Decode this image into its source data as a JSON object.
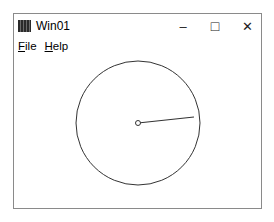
{
  "window": {
    "title": "Win01",
    "app_icon": "app-icon",
    "controls": {
      "minimize": "–",
      "maximize": "□",
      "close": "✕"
    }
  },
  "menubar": {
    "items": [
      {
        "label_first": "F",
        "label_rest": "ile"
      },
      {
        "label_first": "H",
        "label_rest": "elp"
      }
    ]
  },
  "drawing": {
    "circle": {
      "cx": 124,
      "cy": 69,
      "r": 62,
      "stroke": "#333333"
    },
    "hand": {
      "x1": 124,
      "y1": 69,
      "x2": 180,
      "y2": 63
    },
    "hub": {
      "cx": 124,
      "cy": 69,
      "r": 2.5
    }
  }
}
